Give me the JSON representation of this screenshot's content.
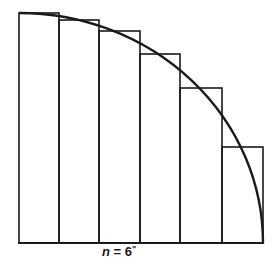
{
  "diagram": {
    "caption": {
      "variable": "n",
      "equals": " = ",
      "value": "6",
      "text": "n = 6"
    },
    "n": 6,
    "colors": {
      "stroke": "#1a1a1a",
      "background": "#ffffff"
    },
    "geometry": {
      "origin_x": 19,
      "baseline_y": 243,
      "right_x": 263,
      "top_y": 13,
      "column_edges_x": [
        19,
        59,
        99,
        140,
        180,
        222,
        263
      ],
      "rect_tops_y": [
        13,
        20,
        31,
        54,
        88,
        147
      ]
    },
    "rectangles": [
      {
        "index": 1,
        "label": "rect-1"
      },
      {
        "index": 2,
        "label": "rect-2"
      },
      {
        "index": 3,
        "label": "rect-3"
      },
      {
        "index": 4,
        "label": "rect-4"
      },
      {
        "index": 5,
        "label": "rect-5"
      },
      {
        "index": 6,
        "label": "rect-6"
      }
    ],
    "curve": {
      "type": "quarter-circle",
      "label": "curve"
    }
  }
}
